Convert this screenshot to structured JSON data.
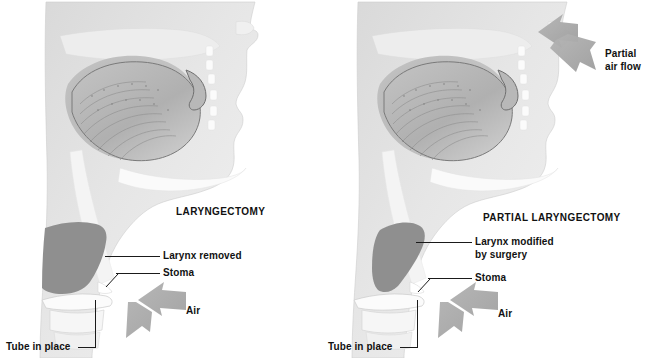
{
  "figure": {
    "kind": "medical-illustration",
    "background_color": "#ffffff",
    "ink_color": "#1a1a1a",
    "tissue_light": "#e8e8e8",
    "tissue_mid": "#c9c9c9",
    "tissue_dark": "#9a9a9a",
    "larynx_fill": "#8f8f8f",
    "arrow_fill": "#a8a8a8"
  },
  "panels": [
    {
      "id": "laryngectomy",
      "title": "LARYNGECTOMY",
      "labels": [
        {
          "key": "larynx",
          "text": "Larynx removed"
        },
        {
          "key": "stoma",
          "text": "Stoma"
        },
        {
          "key": "air",
          "text": "Air"
        },
        {
          "key": "tube",
          "text": "Tube in place"
        }
      ]
    },
    {
      "id": "partial-laryngectomy",
      "title": "PARTIAL LARYNGECTOMY",
      "labels": [
        {
          "key": "partial_air_flow_line1",
          "text": "Partial"
        },
        {
          "key": "partial_air_flow_line2",
          "text": "air flow"
        },
        {
          "key": "larynx_line1",
          "text": "Larynx modified"
        },
        {
          "key": "larynx_line2",
          "text": "by surgery"
        },
        {
          "key": "stoma",
          "text": "Stoma"
        },
        {
          "key": "air",
          "text": "Air"
        },
        {
          "key": "tube",
          "text": "Tube in place"
        }
      ]
    }
  ]
}
